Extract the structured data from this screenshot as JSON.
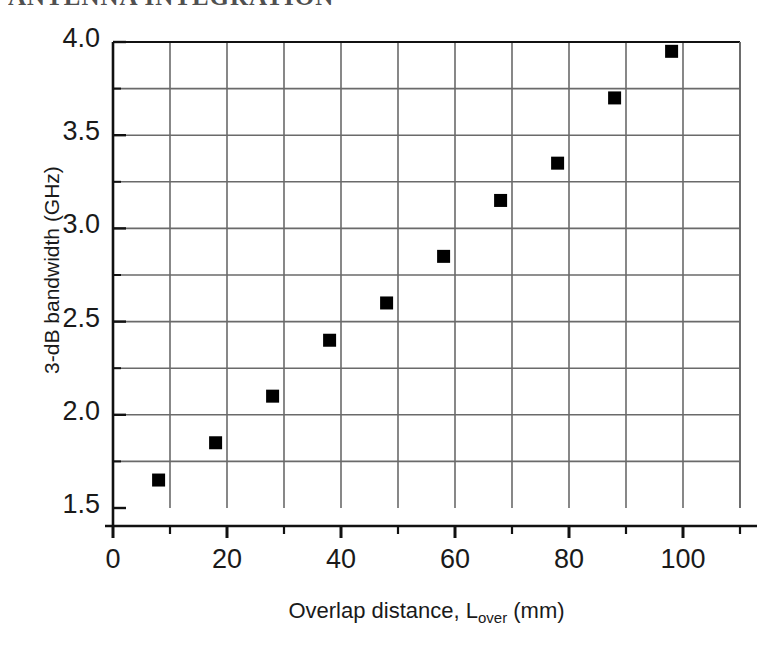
{
  "scan": {
    "cut_off_header_text": "ANTENNA INTEGRATION"
  },
  "chart_data": {
    "type": "scatter",
    "title": "",
    "xlabel": "Overlap distance, L",
    "xlabel_sub": "over",
    "xlabel_unit": " (mm)",
    "xlabel_full": "Overlap distance, Lover (mm)",
    "ylabel": "3-dB bandwidth (GHz)",
    "xlim": [
      0,
      110
    ],
    "ylim": [
      1.5,
      4.0
    ],
    "x_major_ticks": [
      0,
      20,
      40,
      60,
      80,
      100
    ],
    "x_major_tick_labels": [
      "0",
      "20",
      "40",
      "60",
      "80",
      "100"
    ],
    "x_minor_ticks": [
      10,
      30,
      50,
      70,
      90,
      110
    ],
    "x_gridlines": [
      0,
      10,
      20,
      30,
      40,
      50,
      60,
      70,
      80,
      90,
      100,
      110
    ],
    "y_major_ticks": [
      1.5,
      2.0,
      2.5,
      3.0,
      3.5,
      4.0
    ],
    "y_major_tick_labels": [
      "1.5",
      "2.0",
      "2.5",
      "3.0",
      "3.5",
      "4.0"
    ],
    "y_minor_ticks": [
      1.75,
      2.25,
      2.75,
      3.25,
      3.75
    ],
    "y_gridlines": [
      1.75,
      2.0,
      2.25,
      2.5,
      2.75,
      3.0,
      3.25,
      3.5,
      3.75
    ],
    "grid": true,
    "legend": null,
    "marker": "filled-square",
    "marker_color": "#000000",
    "marker_size_px": 13,
    "series": [
      {
        "name": "3-dB bandwidth vs overlap distance",
        "x": [
          8,
          18,
          28,
          38,
          48,
          58,
          68,
          78,
          88,
          98
        ],
        "y": [
          1.65,
          1.85,
          2.1,
          2.4,
          2.6,
          2.85,
          3.15,
          3.35,
          3.7,
          3.95
        ]
      }
    ]
  },
  "colors": {
    "axis": "#111111",
    "grid": "#6a6a6a",
    "marker": "#000000",
    "background": "#ffffff",
    "text": "#1a1a1a"
  }
}
